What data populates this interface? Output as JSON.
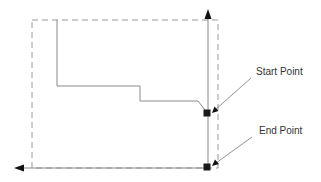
{
  "diagram": {
    "labels": {
      "start_point": "Start Point",
      "end_point": "End Point"
    },
    "colors": {
      "line": "#888888",
      "dashed": "#999999",
      "marker": "#1a1a1a",
      "arrow": "#111111",
      "text": "#333333"
    },
    "elements": {
      "dashed_boundary": "dashed-rectangle",
      "vertical_axis": "arrow-up",
      "horizontal_axis": "arrow-left",
      "stepped_path": "polyline",
      "start_marker": "filled-square",
      "end_marker": "filled-square"
    }
  }
}
